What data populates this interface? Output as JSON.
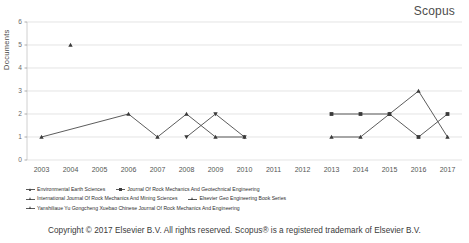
{
  "title": "Scopus",
  "footer": "Copyright © 2017 Elsevier B.V. All rights reserved. Scopus® is a registered trademark of Elsevier B.V.",
  "legend": {
    "rows": [
      [
        {
          "label": "Environmental Earth Sciences",
          "marker": "triangle"
        },
        {
          "label": "Journal Of Rock Mechanics And Geotechnical Engineering",
          "marker": "square"
        }
      ],
      [
        {
          "label": "International Journal Of Rock Mechanics And Mining Sciences",
          "marker": "triangle"
        },
        {
          "label": "Elsevier Geo Engineering Book Series",
          "marker": "triangle"
        }
      ],
      [
        {
          "label": "Yanshiliaue Yu Gongcheng Xuebao Chinese Journal Of Rock Mechanics And Engineering",
          "marker": "triangle"
        }
      ]
    ]
  },
  "chart_data": {
    "type": "line",
    "title": "Scopus",
    "xlabel": "",
    "ylabel": "Documents",
    "categories": [
      "2003",
      "2004",
      "2005",
      "2006",
      "2007",
      "2008",
      "2009",
      "2010",
      "2011",
      "2012",
      "2013",
      "2014",
      "2015",
      "2016",
      "2017"
    ],
    "ylim": [
      0,
      6
    ],
    "yticks": [
      0,
      1,
      2,
      3,
      4,
      5,
      6
    ],
    "grid": true,
    "legend_position": "bottom",
    "series": [
      {
        "name": "Environmental Earth Sciences",
        "marker": "triangle",
        "points": [
          {
            "x": "2004",
            "y": 5
          }
        ]
      },
      {
        "name": "Journal Of Rock Mechanics And Geotechnical Engineering",
        "marker": "square",
        "points": [
          {
            "x": "2013",
            "y": 2
          },
          {
            "x": "2014",
            "y": 2
          },
          {
            "x": "2015",
            "y": 2
          },
          {
            "x": "2016",
            "y": 1
          },
          {
            "x": "2017",
            "y": 2
          }
        ]
      },
      {
        "name": "International Journal Of Rock Mechanics And Mining Sciences",
        "marker": "triangle",
        "points": [
          {
            "x": "2003",
            "y": 1
          },
          {
            "x": "2006",
            "y": 2
          },
          {
            "x": "2007",
            "y": 1
          },
          {
            "x": "2008",
            "y": 2
          },
          {
            "x": "2009",
            "y": 1
          },
          {
            "x": "2010",
            "y": 1
          }
        ]
      },
      {
        "name": "Elsevier Geo Engineering Book Series",
        "marker": "triangle",
        "points": [
          {
            "x": "2008",
            "y": 1
          },
          {
            "x": "2009",
            "y": 2
          },
          {
            "x": "2010",
            "y": 1
          }
        ]
      },
      {
        "name": "Yanshiliaue Yu Gongcheng Xuebao Chinese Journal Of Rock Mechanics And Engineering",
        "marker": "triangle",
        "points": [
          {
            "x": "2013",
            "y": 1
          },
          {
            "x": "2014",
            "y": 1
          },
          {
            "x": "2015",
            "y": 2
          },
          {
            "x": "2016",
            "y": 3
          },
          {
            "x": "2017",
            "y": 1
          }
        ]
      }
    ]
  },
  "colors": {
    "line": "#4a4a4a",
    "grid": "#d9d9d9",
    "text": "#4a4a4a"
  }
}
